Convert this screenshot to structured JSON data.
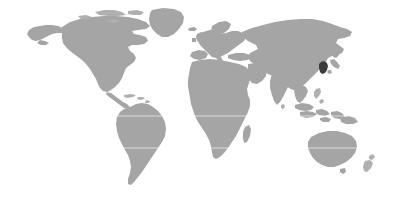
{
  "figure": {
    "type": "world-locator-map",
    "width": 413,
    "height": 200,
    "projection": "robinson"
  },
  "colors": {
    "background": "#ffffff",
    "land": "#a5a5a5",
    "land_light": "#b4b4b4",
    "highlight": "#3b3b3b",
    "graticule": "#ffffff"
  },
  "highlight": {
    "name": "South Korea",
    "region": "Korean Peninsula",
    "continent": "Asia",
    "center_x": 323,
    "center_y": 68,
    "color": "#3b3b3b"
  },
  "regions": [
    {
      "name": "North America",
      "color": "#a5a5a5"
    },
    {
      "name": "Greenland",
      "color": "#a5a5a5"
    },
    {
      "name": "South America",
      "color": "#a5a5a5"
    },
    {
      "name": "Europe",
      "color": "#a5a5a5"
    },
    {
      "name": "Africa",
      "color": "#a5a5a5"
    },
    {
      "name": "Asia",
      "color": "#a5a5a5"
    },
    {
      "name": "Southeast Asia",
      "color": "#a5a5a5"
    },
    {
      "name": "Australia",
      "color": "#a5a5a5"
    },
    {
      "name": "New Zealand",
      "color": "#a5a5a5"
    },
    {
      "name": "Japan",
      "color": "#a5a5a5"
    },
    {
      "name": "Madagascar",
      "color": "#a5a5a5"
    },
    {
      "name": "British Isles",
      "color": "#a5a5a5"
    },
    {
      "name": "Iceland",
      "color": "#a5a5a5"
    },
    {
      "name": "Caribbean",
      "color": "#a5a5a5"
    },
    {
      "name": "Sri Lanka",
      "color": "#a5a5a5"
    },
    {
      "name": "Papua New Guinea",
      "color": "#a5a5a5"
    }
  ],
  "graticules": [
    {
      "name": "equator",
      "y": 116
    },
    {
      "name": "tropic-of-capricorn",
      "y": 148
    }
  ]
}
